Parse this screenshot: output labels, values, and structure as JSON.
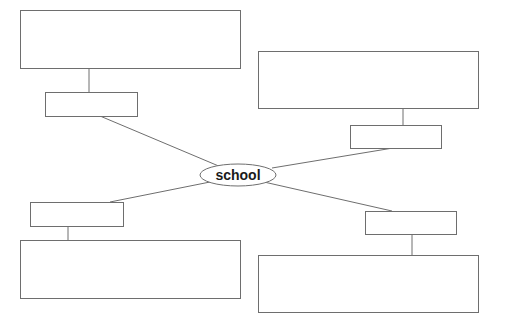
{
  "diagram": {
    "type": "mind-map",
    "center": {
      "label": "school"
    },
    "branches": [
      {
        "position": "top-left",
        "label_box_text": "",
        "detail_box_text": ""
      },
      {
        "position": "top-right",
        "label_box_text": "",
        "detail_box_text": ""
      },
      {
        "position": "bottom-left",
        "label_box_text": "",
        "detail_box_text": ""
      },
      {
        "position": "bottom-right",
        "label_box_text": "",
        "detail_box_text": ""
      }
    ],
    "colors": {
      "stroke": "#6e6e6e",
      "background": "#ffffff",
      "text": "#1a1a1a"
    }
  }
}
